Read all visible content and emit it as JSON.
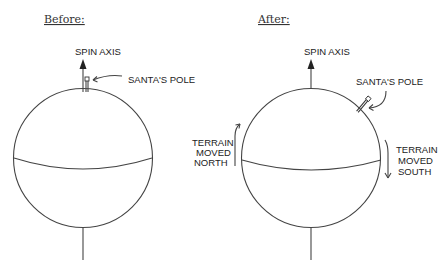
{
  "panels": {
    "before": {
      "title": "Before:",
      "spin_axis_label": "SPIN AXIS",
      "pole_label": "SANTA'S POLE"
    },
    "after": {
      "title": "After:",
      "spin_axis_label": "SPIN AXIS",
      "pole_label": "SANTA'S POLE",
      "left_annotation": [
        "TERRAIN",
        "MOVED",
        "NORTH"
      ],
      "right_annotation": [
        "TERRAIN",
        "MOVED",
        "SOUTH"
      ]
    }
  }
}
